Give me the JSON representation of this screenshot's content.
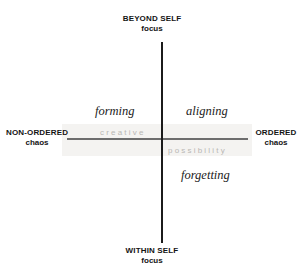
{
  "diagram": {
    "type": "two-axis-quadrant-matrix",
    "axes": {
      "vertical": {
        "color": "#1b1b1b",
        "top_pole": {
          "major": "BEYOND SELF",
          "minor": "focus"
        },
        "bottom_pole": {
          "major": "WITHIN SELF",
          "minor": "focus"
        }
      },
      "horizontal": {
        "color": "#6d6d6d",
        "left_pole": {
          "major": "NON-ORDERED",
          "minor": "chaos"
        },
        "right_pole": {
          "major": "ORDERED",
          "minor": "chaos"
        }
      }
    },
    "quadrant_labels": {
      "top_left": "forming",
      "top_right": "aligning",
      "bottom_right": "forgetting"
    },
    "centre_labels": {
      "upper_left": "creative",
      "lower_right": "possibility",
      "color": "#b9b7b4"
    }
  }
}
